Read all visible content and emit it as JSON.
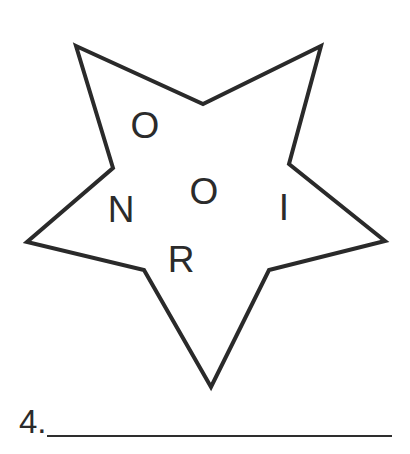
{
  "puzzle": {
    "shape": "star",
    "stroke_color": "#2a2a2a",
    "fill_color": "#ffffff",
    "star_points": "76,46 203,104 321,46 289,164 385,241 269,270 211,387 144,270 27,242 113,168",
    "letters": [
      {
        "char": "O",
        "x": 145,
        "y": 125
      },
      {
        "char": "N",
        "x": 121,
        "y": 209
      },
      {
        "char": "O",
        "x": 204,
        "y": 191
      },
      {
        "char": "I",
        "x": 284,
        "y": 207
      },
      {
        "char": "R",
        "x": 181,
        "y": 259
      }
    ]
  },
  "answer": {
    "number_label": "4.",
    "value": ""
  }
}
